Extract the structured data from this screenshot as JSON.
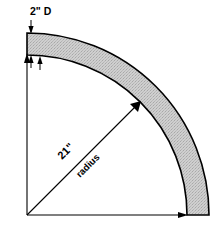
{
  "diagram": {
    "background_color": "#ffffff",
    "outline_color": "#000000",
    "fill_color": "#cccccc",
    "labels": {
      "depth": "2\" D",
      "radius_value": "21\"",
      "radius_word": "radius"
    },
    "geometry": {
      "origin_x": 27,
      "origin_y": 215,
      "inner_radius": 160,
      "outer_radius": 182,
      "sweep_start_deg": 90,
      "sweep_end_deg": 0,
      "band_thickness": 22,
      "radius_arrow_angle_deg": -45
    }
  }
}
